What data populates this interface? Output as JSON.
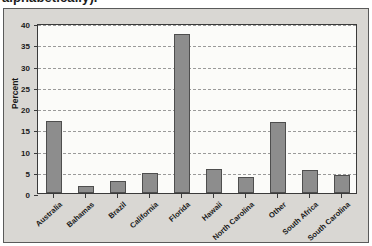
{
  "caption": {
    "text": "alphabetically)."
  },
  "chart_data": {
    "type": "bar",
    "title": "",
    "xlabel": "",
    "ylabel": "Percent",
    "ylim": [
      0,
      40
    ],
    "ytick_step": 5,
    "yticks": [
      0,
      5,
      10,
      15,
      20,
      25,
      30,
      35,
      40
    ],
    "grid": true,
    "legend": "none",
    "bar_color": "#8d8d8d",
    "bar_border_color": "#4e4e4e",
    "plot_background": "#fbfbf9",
    "panel_background": "#d9d7d3",
    "gridline_color": "#9a9a9a",
    "axis_color": "#3a3a3a",
    "categories": [
      "Australia",
      "Bahamas",
      "Brazil",
      "California",
      "Florida",
      "Hawaii",
      "North Carolina",
      "Other",
      "South Africa",
      "South Carolina"
    ],
    "values": [
      16.9,
      1.7,
      2.8,
      4.6,
      37.3,
      5.6,
      3.8,
      16.8,
      5.5,
      4.3
    ]
  }
}
